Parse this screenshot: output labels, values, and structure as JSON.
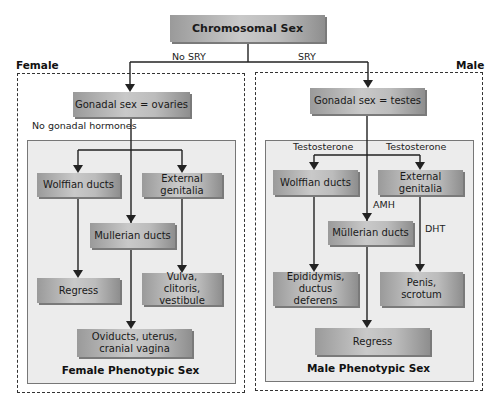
{
  "root": {
    "label": "Chromosomal Sex"
  },
  "branches": {
    "female_condition": "No SRY",
    "male_condition": "SRY"
  },
  "female": {
    "section_label": "Female",
    "gonadal": "Gonadal sex = ovaries",
    "hormone_note": "No gonadal hormones",
    "wolffian": "Wolffian ducts",
    "external": "External genitalia",
    "mullerian": "Mullerian ducts",
    "wolffian_outcome": "Regress",
    "external_outcome": "Vulva, clitoris, vestibule",
    "mullerian_outcome": "Oviducts, uterus, cranial vagina",
    "phenotype": "Female Phenotypic Sex"
  },
  "male": {
    "section_label": "Male",
    "gonadal": "Gonadal sex = testes",
    "hormone_wolffian": "Testosterone",
    "hormone_external": "Testosterone",
    "hormone_mullerian": "AMH",
    "hormone_dht": "DHT",
    "wolffian": "Wolffian ducts",
    "external": "External genitalia",
    "mullerian": "Müllerian ducts",
    "wolffian_outcome": "Epididymis, ductus deferens",
    "external_outcome": "Penis, scrotum",
    "mullerian_outcome": "Regress",
    "phenotype": "Male Phenotypic Sex"
  },
  "colors": {
    "box_mid": "#c9c9c9",
    "box_edge": "#8e8e8e",
    "panel": "#ececec",
    "line": "#222222"
  }
}
